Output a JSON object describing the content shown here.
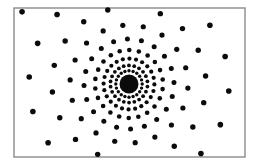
{
  "figure": {
    "kind": "radial-dot-pattern",
    "width": 257,
    "height": 165,
    "background_color": "#ffffff",
    "dot_color": "#0b0b0b",
    "frame": {
      "name": "rectangular-border",
      "x": 14,
      "y": 8,
      "width": 231,
      "height": 149,
      "stroke_color": "#8a8a8a",
      "stroke_width": 1.4,
      "fill_color": "#ffffff"
    },
    "center": {
      "x": 129,
      "y": 84
    },
    "core": {
      "name": "solid-center-blob",
      "radius": 9.5,
      "color": "#0b0b0b"
    }
  },
  "chart_data": {
    "type": "scatter",
    "subtitle": "",
    "xlabel": "",
    "ylabel": "",
    "xlim": [
      14,
      245
    ],
    "ylim": [
      8,
      157
    ],
    "grid": false,
    "legend": false,
    "center": {
      "x": 129,
      "y": 84
    },
    "core_radius": 9.5,
    "rings": [
      {
        "index": 1,
        "radius": 13.2,
        "count": 20,
        "dot_radius": 1.7,
        "phase_deg": 0
      },
      {
        "index": 2,
        "radius": 18.6,
        "count": 22,
        "dot_radius": 1.9,
        "phase_deg": 8
      },
      {
        "index": 3,
        "radius": 25.4,
        "count": 24,
        "dot_radius": 2.1,
        "phase_deg": 16
      },
      {
        "index": 4,
        "radius": 34.0,
        "count": 22,
        "dot_radius": 2.3,
        "phase_deg": 25
      },
      {
        "index": 5,
        "radius": 45.0,
        "count": 20,
        "dot_radius": 2.5,
        "phase_deg": 34
      },
      {
        "index": 6,
        "radius": 59.0,
        "count": 18,
        "dot_radius": 2.6,
        "phase_deg": 44
      },
      {
        "index": 7,
        "radius": 77.0,
        "count": 18,
        "dot_radius": 2.7,
        "phase_deg": 54
      },
      {
        "index": 8,
        "radius": 100.0,
        "count": 18,
        "dot_radius": 2.8,
        "phase_deg": 64
      },
      {
        "index": 9,
        "radius": 129.0,
        "count": 18,
        "dot_radius": 2.8,
        "phase_deg": 74
      }
    ]
  }
}
